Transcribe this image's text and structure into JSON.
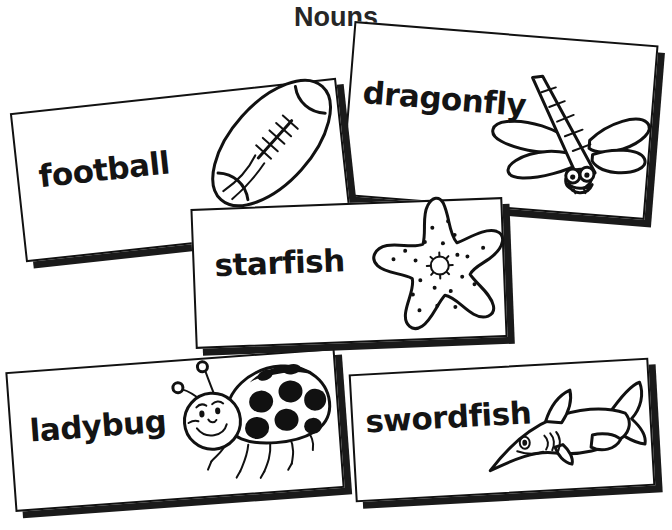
{
  "page": {
    "title": "Nouns",
    "background_color": "#ffffff",
    "ink_color": "#111111",
    "title_color": "#262626"
  },
  "cards": [
    {
      "id": "football",
      "word": "football",
      "illustration": "football-illustration",
      "rotation_deg": -6.2,
      "shadow": "drop-shadow"
    },
    {
      "id": "dragonfly",
      "word": "dragonfly",
      "illustration": "dragonfly-illustration",
      "rotation_deg": 4.6,
      "shadow": "drop-shadow"
    },
    {
      "id": "starfish",
      "word": "starfish",
      "illustration": "starfish-illustration",
      "rotation_deg": -2.2,
      "shadow": "drop-shadow"
    },
    {
      "id": "ladybug",
      "word": "ladybug",
      "illustration": "ladybug-illustration",
      "rotation_deg": -4.2,
      "shadow": "drop-shadow"
    },
    {
      "id": "swordfish",
      "word": "swordfish",
      "illustration": "swordfish-illustration",
      "rotation_deg": -3.2,
      "shadow": "drop-shadow"
    }
  ]
}
